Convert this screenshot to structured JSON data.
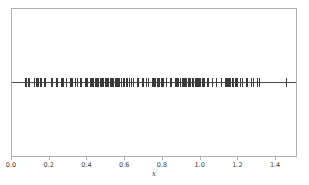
{
  "figure": {
    "background_color": "#ffffff",
    "frame_color": "#aeaeae",
    "marker_color": "#3b3b3b",
    "line_color": "#4c4c4c"
  },
  "axis": {
    "xlabel_base": "x",
    "xlabel_prime": "′",
    "tick_labels": [
      "0.0",
      "0.2",
      "0.4",
      "0.6",
      "0.8",
      "1.0",
      "1.2",
      "1.4"
    ],
    "tick_values": [
      0.0,
      0.2,
      0.4,
      0.6,
      0.8,
      1.0,
      1.2,
      1.4
    ]
  },
  "chart_data": {
    "type": "scatter",
    "title": "",
    "subtitle": "",
    "xlabel": "x′",
    "ylabel": "",
    "xlim": [
      0.0,
      1.5055
    ],
    "ylim": [
      0.0,
      1.0
    ],
    "grid": false,
    "legend": null,
    "annotations": [],
    "marker": "vertical-dash",
    "series": [
      {
        "name": "samples",
        "y_constant": 0.5,
        "x": [
          0.069,
          0.074,
          0.086,
          0.091,
          0.118,
          0.127,
          0.131,
          0.135,
          0.14,
          0.146,
          0.152,
          0.168,
          0.176,
          0.205,
          0.214,
          0.232,
          0.241,
          0.258,
          0.266,
          0.271,
          0.288,
          0.305,
          0.312,
          0.318,
          0.335,
          0.344,
          0.361,
          0.368,
          0.385,
          0.392,
          0.398,
          0.413,
          0.42,
          0.426,
          0.432,
          0.438,
          0.444,
          0.45,
          0.456,
          0.467,
          0.473,
          0.479,
          0.485,
          0.491,
          0.497,
          0.505,
          0.511,
          0.517,
          0.523,
          0.529,
          0.535,
          0.544,
          0.55,
          0.556,
          0.562,
          0.568,
          0.58,
          0.586,
          0.592,
          0.604,
          0.612,
          0.618,
          0.633,
          0.641,
          0.66,
          0.668,
          0.688,
          0.695,
          0.712,
          0.72,
          0.742,
          0.748,
          0.754,
          0.76,
          0.766,
          0.772,
          0.778,
          0.79,
          0.796,
          0.802,
          0.818,
          0.836,
          0.843,
          0.862,
          0.87,
          0.876,
          0.882,
          0.893,
          0.899,
          0.905,
          0.911,
          0.917,
          0.923,
          0.934,
          0.94,
          0.946,
          0.952,
          0.958,
          0.968,
          0.974,
          0.98,
          0.986,
          0.992,
          0.998,
          1.008,
          1.014,
          1.02,
          1.034,
          1.041,
          1.06,
          1.082,
          1.108,
          1.128,
          1.134,
          1.14,
          1.146,
          1.152,
          1.158,
          1.164,
          1.17,
          1.18,
          1.186,
          1.192,
          1.21,
          1.218,
          1.24,
          1.248,
          1.268,
          1.276,
          1.3,
          1.308,
          1.452
        ]
      }
    ]
  }
}
